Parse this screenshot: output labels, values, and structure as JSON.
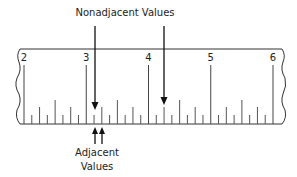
{
  "diagram": {
    "type": "ruler-annotation",
    "top_label": "Nonadjacent Values",
    "bottom_label_line1": "Adjacent",
    "bottom_label_line2": "Values",
    "ruler": {
      "major_labels": [
        "2",
        "3",
        "4",
        "5",
        "6"
      ],
      "subdivisions_per_unit": 8,
      "range": [
        2,
        6
      ]
    },
    "nonadjacent_points": [
      3.125,
      4.5
    ],
    "adjacent_points": [
      3.125,
      3.25
    ],
    "colors": {
      "line": "#222222",
      "tick": "#444444",
      "text": "#222222",
      "background": "#ffffff"
    }
  }
}
